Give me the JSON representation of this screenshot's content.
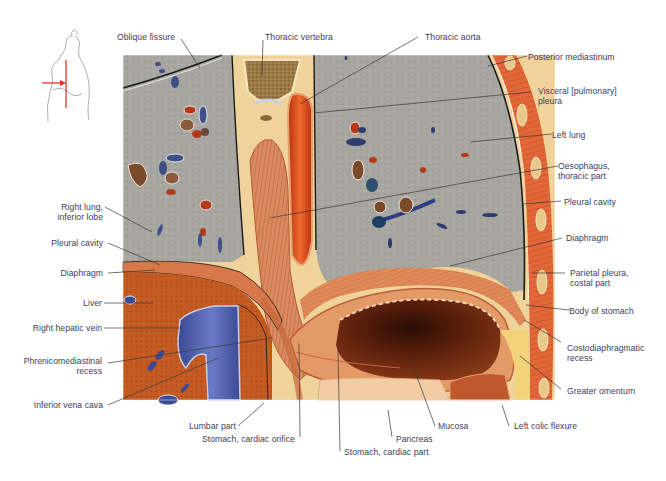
{
  "figure": {
    "type": "anatomical-illustration",
    "orientation_inset": {
      "description": "Outline of torso in lateral view with red vertical section line and red arrow indicating viewing direction",
      "section_line_color": "#e8322a",
      "arrow_color": "#e8322a"
    }
  },
  "labels": {
    "top": [
      {
        "id": "oblique-fissure",
        "text": "Oblique fissure"
      },
      {
        "id": "thoracic-vertebra",
        "text": "Thoracic vertebra"
      },
      {
        "id": "thoracic-aorta",
        "text": "Thoracic aorta"
      }
    ],
    "right": [
      {
        "id": "posterior-mediastinum",
        "text": "Posterior mediastinum"
      },
      {
        "id": "visceral-pleura",
        "line1": "Visceral [pulmonary]",
        "line2": "pleura"
      },
      {
        "id": "left-lung",
        "text": "Left lung"
      },
      {
        "id": "oesophagus-thoracic",
        "line1": "Oesophagus,",
        "line2": "thoracic part"
      },
      {
        "id": "pleural-cavity-right",
        "text": "Pleural cavity"
      },
      {
        "id": "diaphragm-right",
        "text": "Diaphragm"
      },
      {
        "id": "parietal-pleura",
        "line1": "Parietal pleura,",
        "line2": "costal part"
      },
      {
        "id": "body-of-stomach",
        "text": "Body of stomach"
      },
      {
        "id": "costodiaphragmatic-recess",
        "line1": "Costodiaphragmatic",
        "line2": "recess"
      },
      {
        "id": "greater-omentum",
        "text": "Greater omentum"
      }
    ],
    "left": [
      {
        "id": "right-lung-inferior-lobe",
        "line1": "Right lung,",
        "line2": "inferior lobe"
      },
      {
        "id": "pleural-cavity-left",
        "text": "Pleural cavity"
      },
      {
        "id": "diaphragm-left",
        "text": "Diaphragm"
      },
      {
        "id": "liver",
        "text": "Liver"
      },
      {
        "id": "right-hepatic-vein",
        "text": "Right hepatic vein"
      },
      {
        "id": "phrenicomediastinal-recess",
        "line1": "Phrenicomediastinal",
        "line2": "recess"
      },
      {
        "id": "inferior-vena-cava",
        "text": "Inferior vena cava"
      }
    ],
    "bottom": [
      {
        "id": "lumbar-part",
        "text": "Lumbar part"
      },
      {
        "id": "stomach-cardiac-orifice",
        "text": "Stomach, cardiac orifice"
      },
      {
        "id": "stomach-cardiac-part",
        "text": "Stomach, cardiac part"
      },
      {
        "id": "pancreas",
        "text": "Pancreas"
      },
      {
        "id": "mucosa",
        "text": "Mucosa"
      },
      {
        "id": "left-colic-flexure",
        "text": "Left colic flexure"
      }
    ]
  },
  "colors": {
    "label_text": "#3b3d5a",
    "leader_line": "#3a3a3a",
    "lung_tissue": "#a9a8a2",
    "liver_tissue": "#c0551f",
    "venous_blood": "#4a5aa8",
    "arterial_wall": "#d9461c",
    "muscle": "#e08a5a",
    "fat": "#f3d27a",
    "bone": "#8a6a3a",
    "stomach_lumen": "#6e2a14"
  }
}
